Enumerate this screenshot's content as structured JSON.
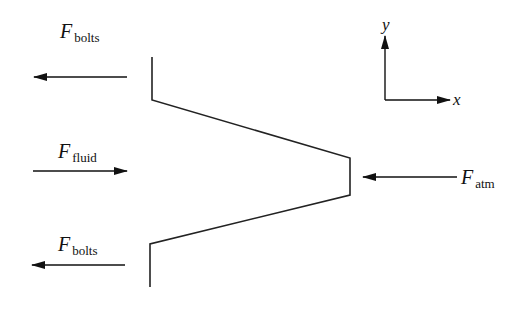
{
  "diagram": {
    "title": "",
    "forces": [
      {
        "id": "bolts-top",
        "symbol": "F",
        "subscript": "bolts",
        "direction": "left"
      },
      {
        "id": "fluid",
        "symbol": "F",
        "subscript": "fluid",
        "direction": "right"
      },
      {
        "id": "bolts-bottom",
        "symbol": "F",
        "subscript": "bolts",
        "direction": "left"
      },
      {
        "id": "atm",
        "symbol": "F",
        "subscript": "atm",
        "direction": "left"
      }
    ],
    "axes": {
      "x_label": "x",
      "y_label": "y"
    },
    "colors": {
      "line": "#222222",
      "background": "#ffffff"
    }
  }
}
